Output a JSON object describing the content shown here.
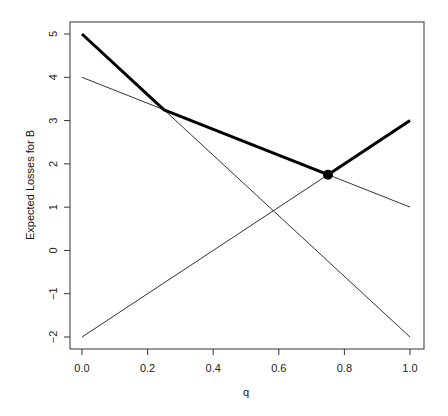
{
  "chart_data": {
    "type": "line",
    "title": "",
    "xlabel": "q",
    "ylabel": "Expected Losses for B",
    "xlim": [
      0,
      1
    ],
    "ylim": [
      -2,
      5
    ],
    "grid": false,
    "legend": null,
    "x_ticks": [
      "0.0",
      "0.2",
      "0.4",
      "0.6",
      "0.8",
      "1.0"
    ],
    "y_ticks": [
      "-2",
      "-1",
      "0",
      "1",
      "2",
      "3",
      "4",
      "5"
    ],
    "series": [
      {
        "name": "line-4-to-1",
        "style": "thin",
        "x": [
          0,
          1
        ],
        "values": [
          4,
          1
        ]
      },
      {
        "name": "line-neg2-to-3",
        "style": "thin",
        "x": [
          0,
          1
        ],
        "values": [
          -2,
          3
        ]
      },
      {
        "name": "line-5-to-neg2",
        "style": "thin",
        "x": [
          0,
          1
        ],
        "values": [
          5,
          -2
        ]
      },
      {
        "name": "upper-envelope",
        "style": "thick",
        "x": [
          0,
          0.25,
          0.75,
          1
        ],
        "values": [
          5,
          3.25,
          1.75,
          3
        ]
      }
    ],
    "annotations": [
      {
        "type": "point",
        "x": 0.75,
        "y": 1.75,
        "label": "minimum"
      }
    ]
  }
}
